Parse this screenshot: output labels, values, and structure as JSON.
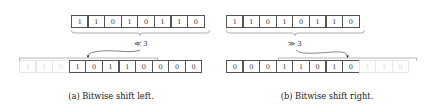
{
  "figure": {
    "left_panel": {
      "input_bits": [
        "1",
        "1",
        "0",
        "1",
        "0",
        "1",
        "1",
        "0"
      ],
      "shifted_out_bits": [
        "1",
        "1",
        "0"
      ],
      "output_bits": [
        "1",
        "0",
        "1",
        "1",
        "0",
        "0",
        "0",
        "0"
      ],
      "operator_label": "≪ 3",
      "caption": "(a) Bitwise shift left."
    },
    "right_panel": {
      "input_bits": [
        "1",
        "1",
        "0",
        "1",
        "0",
        "1",
        "1",
        "0"
      ],
      "output_bits": [
        "0",
        "0",
        "0",
        "1",
        "1",
        "0",
        "1",
        "0"
      ],
      "shifted_out_bits": [
        "1",
        "1",
        "0"
      ],
      "operator_label": "≫ 3",
      "caption": "(b) Bitwise shift right."
    },
    "colors": {
      "cell_border": "#555555",
      "faded_cell_border": "#e6e6e6",
      "faded_text": "#d6d6d6",
      "text": "#222222"
    }
  }
}
